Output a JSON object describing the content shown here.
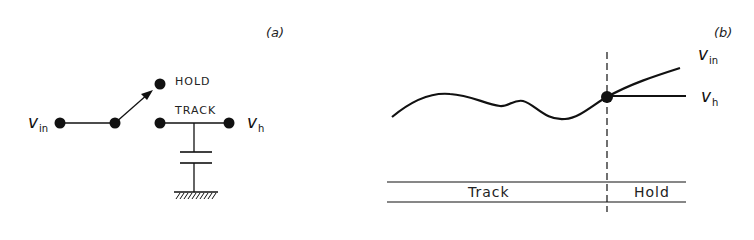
{
  "panel_a": {
    "label": "(a)",
    "input": {
      "symbol": "v",
      "subscript": "in"
    },
    "output": {
      "symbol": "v",
      "subscript": "h"
    },
    "switch_positions": {
      "hold": "HOLD",
      "track": "TRACK"
    },
    "components": [
      "input-node",
      "switch-pivot",
      "hold-contact",
      "track-contact",
      "output-node",
      "hold-capacitor",
      "ground"
    ]
  },
  "panel_b": {
    "label": "(b)",
    "signals": [
      {
        "symbol": "v",
        "subscript": "in"
      },
      {
        "symbol": "v",
        "subscript": "h"
      }
    ],
    "modes": [
      "Track",
      "Hold"
    ]
  },
  "colors": {
    "ink": "#111111",
    "background": "#ffffff"
  }
}
